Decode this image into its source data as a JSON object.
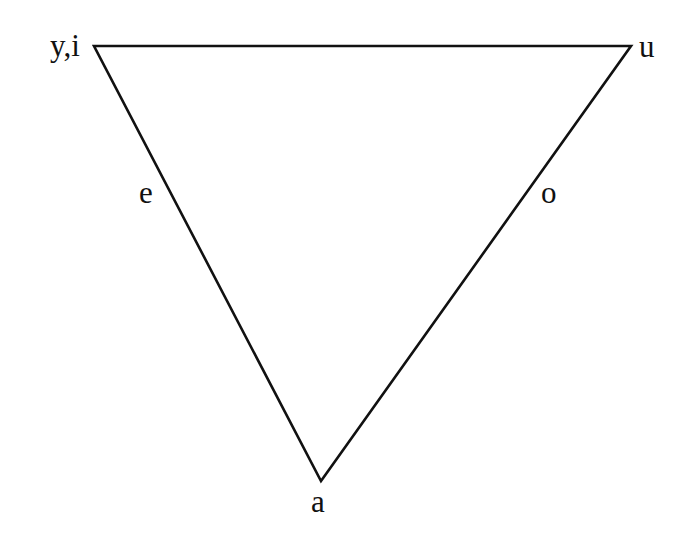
{
  "diagram": {
    "type": "vowel-triangle",
    "stroke_color": "#111111",
    "background": "#ffffff",
    "vertices": {
      "top_left": {
        "label": "y,i",
        "x": 94,
        "y": 46
      },
      "top_right": {
        "label": "u",
        "x": 631,
        "y": 46
      },
      "bottom": {
        "label": "a",
        "x": 321,
        "y": 481
      }
    },
    "edge_labels": {
      "left": {
        "label": "e"
      },
      "right": {
        "label": "o"
      }
    }
  }
}
